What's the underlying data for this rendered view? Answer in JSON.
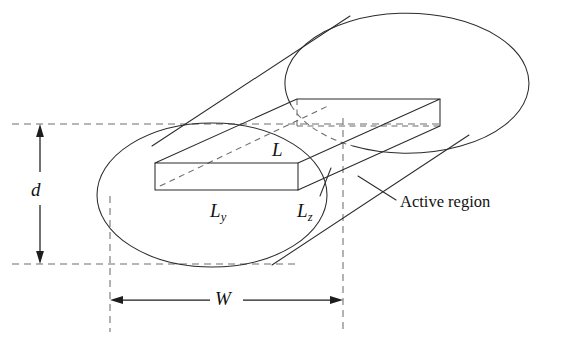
{
  "figure": {
    "background_color": "#ffffff",
    "line_color": "#2b2b2b",
    "hidden_line_color": "#6b6b6b",
    "reference_line_color": "#6e6e6e"
  },
  "labels": {
    "d": "d",
    "W": "W",
    "L": "L",
    "Ly_base": "L",
    "Ly_sub": "y",
    "Lz_base": "L",
    "Lz_sub": "z",
    "active_region": "Active region"
  },
  "dimensions": {
    "d": {
      "label": "d",
      "orientation": "vertical",
      "arrow_x": 40,
      "from_y": 124,
      "to_y": 264
    },
    "W": {
      "label": "W",
      "orientation": "horizontal",
      "arrow_y": 300,
      "from_x": 110,
      "to_x": 343
    }
  },
  "shapes": {
    "near_ellipse": {
      "cx": 212,
      "cy": 195,
      "rx": 115,
      "ry": 72
    },
    "far_ellipse": {
      "cx": 408,
      "cy": 86,
      "rx": 122,
      "ry": 70
    },
    "slab": {
      "description": "rectangular active region slab drawn in oblique projection",
      "front_face_left_x": 155,
      "front_face_right_x": 298,
      "front_face_top_y": 163,
      "front_face_bottom_y": 190
    }
  },
  "callouts": [
    {
      "label": "Active region",
      "leader_from_x": 396,
      "leader_from_y": 200,
      "leader_to_x": 358,
      "leader_to_y": 176
    }
  ]
}
